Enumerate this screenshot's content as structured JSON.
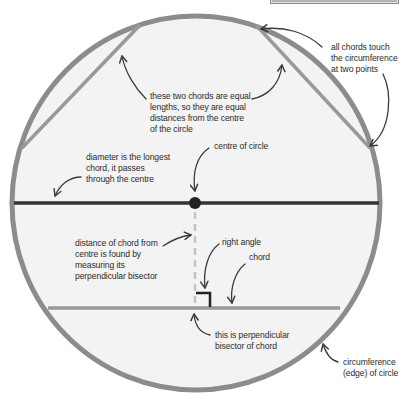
{
  "colors": {
    "background": "#ffffff",
    "circle_fill": "#f3f3f3",
    "circumference": "#8c8c8c",
    "chord": "#999999",
    "diameter": "#333333",
    "centre_dot": "#222222",
    "bisector_dash": "#c4c4c4",
    "right_angle": "#222222",
    "arrow": "#3a3a3a",
    "text": "#2b2b2b"
  },
  "geometry": {
    "circle": {
      "cx": 196,
      "cy": 203,
      "rx": 184,
      "ry": 187
    },
    "diameter": {
      "x1": 14,
      "y1": 203,
      "x2": 379,
      "y2": 203
    },
    "centre": {
      "x": 195,
      "y": 203
    },
    "upper_left_chord": {
      "x1": 140,
      "y1": 25,
      "x2": 22,
      "y2": 148
    },
    "upper_right_chord": {
      "x1": 256,
      "y1": 25,
      "x2": 370,
      "y2": 148
    },
    "lower_chord": {
      "x1": 48,
      "y1": 308,
      "x2": 340,
      "y2": 308
    },
    "bisector": {
      "x": 195,
      "y1": 210,
      "y2": 308
    },
    "right_angle_marker": {
      "x1": 196,
      "y1": 292,
      "x2": 210,
      "y2": 308
    }
  },
  "labels": {
    "equal_chords": "these two chords are equal\nlengths, so they are equal\ndistances from the centre\nof the circle",
    "chords_touch": "all chords touch\nthe circumference\nat two points",
    "centre_of_circle": "centre of circle",
    "diameter": "diameter is the longest\nchord, it passes\nthrough the centre",
    "distance_of_chord": "distance of chord from\ncentre is found by\nmeasuring its\nperpendicular bisector",
    "right_angle": "right angle",
    "chord": "chord",
    "perpendicular_bisector": "this is perpendicular\nbisector of chord",
    "circumference": "circumference\n(edge) of circle"
  }
}
